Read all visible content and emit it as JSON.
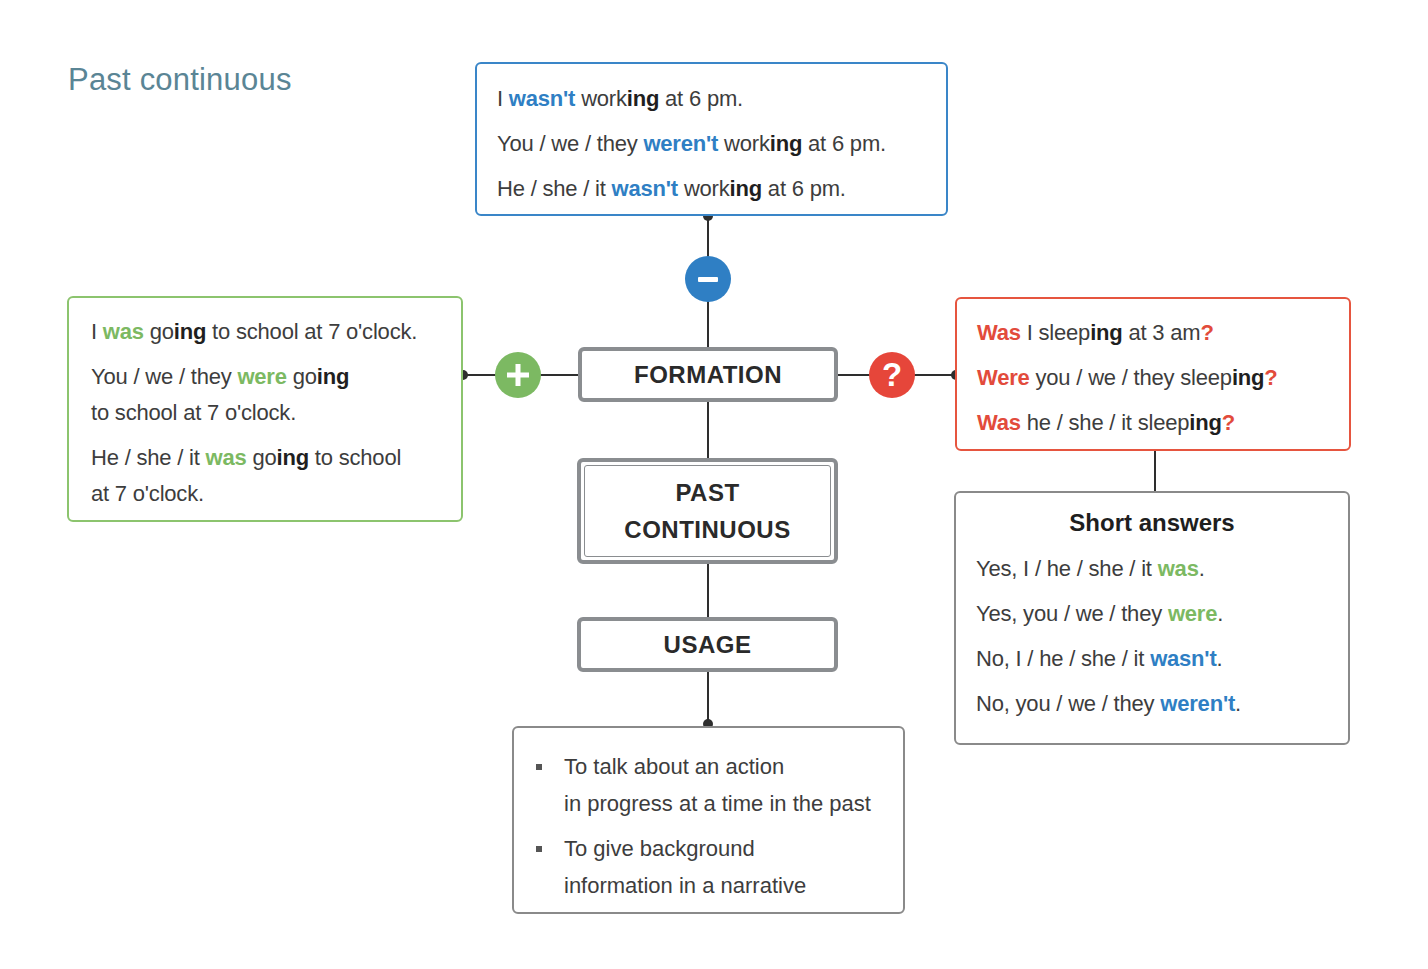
{
  "title": "Past continuous",
  "colors": {
    "title": "#5a8595",
    "negative": "#2f7fc4",
    "positive": "#7cb962",
    "question": "#e24b3b",
    "node_border": "#8a8d90"
  },
  "negative": {
    "icon": "minus-icon",
    "lines": [
      {
        "pre": "I ",
        "aux": "wasn't",
        "verb": " work",
        "ing": "ing",
        "post": " at 6 pm."
      },
      {
        "pre": "You / we / they ",
        "aux": "weren't",
        "verb": " work",
        "ing": "ing",
        "post": " at 6 pm."
      },
      {
        "pre": "He / she / it ",
        "aux": "wasn't",
        "verb": " work",
        "ing": "ing",
        "post": " at 6 pm."
      }
    ]
  },
  "positive": {
    "icon": "plus-icon",
    "lines": [
      {
        "pre": "I ",
        "aux": "was",
        "verb": " go",
        "ing": "ing",
        "post": " to school at 7 o'clock.",
        "post2": ""
      },
      {
        "pre": "You / we / they ",
        "aux": "were",
        "verb": " go",
        "ing": "ing",
        "post": "",
        "post2": "to school at 7 o'clock."
      },
      {
        "pre": "He / she / it ",
        "aux": "was",
        "verb": " go",
        "ing": "ing",
        "post": " to school",
        "post2": "at 7 o'clock."
      }
    ]
  },
  "question": {
    "icon": "question-icon",
    "symbol": "?",
    "lines": [
      {
        "aux": "Was",
        "mid": " I sleep",
        "ing": "ing",
        "post": " at 3 am",
        "q": "?"
      },
      {
        "aux": "Were",
        "mid": " you / we / they sleep",
        "ing": "ing",
        "post": "",
        "q": "?"
      },
      {
        "aux": "Was",
        "mid": " he / she / it sleep",
        "ing": "ing",
        "post": "",
        "q": "?"
      }
    ]
  },
  "short_answers": {
    "title": "Short answers",
    "lines": [
      {
        "pre": "Yes, I / he / she / it ",
        "word": "was",
        "post": "."
      },
      {
        "pre": "Yes, you / we / they ",
        "word": "were",
        "post": "."
      },
      {
        "pre": "No, I / he / she / it ",
        "word": "wasn't",
        "post": "."
      },
      {
        "pre": "No, you / we / they ",
        "word": "weren't",
        "post": "."
      }
    ]
  },
  "nodes": {
    "formation": "FORMATION",
    "center_line1": "PAST",
    "center_line2": "CONTINUOUS",
    "usage": "USAGE"
  },
  "usage": {
    "items": [
      {
        "line1": "To talk about an action",
        "line2": "in progress at a time in the past"
      },
      {
        "line1": "To give background",
        "line2": "information in a narrative"
      }
    ]
  }
}
